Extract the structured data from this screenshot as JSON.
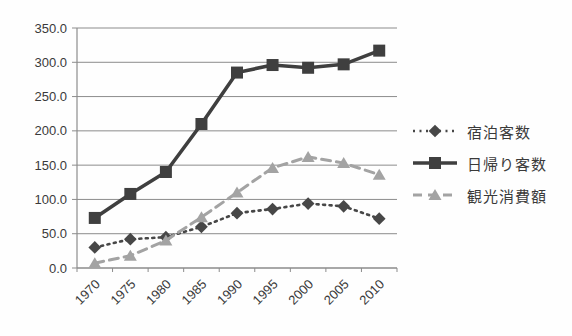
{
  "chart_data": {
    "type": "line",
    "title": "",
    "xlabel": "",
    "ylabel": "",
    "categories": [
      "1970",
      "1975",
      "1980",
      "1985",
      "1990",
      "1995",
      "2000",
      "2005",
      "2010"
    ],
    "series": [
      {
        "name": "宿泊客数",
        "values": [
          30,
          42,
          45,
          60,
          80,
          86,
          94,
          90,
          72
        ],
        "color": "#474747",
        "line_style": "dotted",
        "marker": "diamond"
      },
      {
        "name": "日帰り客数",
        "values": [
          73,
          108,
          140,
          210,
          285,
          296,
          292,
          297,
          317
        ],
        "color": "#3f3f3f",
        "line_style": "solid",
        "marker": "square"
      },
      {
        "name": "観光消費額",
        "values": [
          7,
          18,
          40,
          74,
          110,
          146,
          162,
          153,
          136
        ],
        "color": "#a3a3a3",
        "line_style": "dashed",
        "marker": "triangle"
      }
    ],
    "ylim": [
      0,
      350
    ],
    "y_tick_step": 50,
    "y_tick_labels": [
      "0.0",
      "50.0",
      "100.0",
      "150.0",
      "200.0",
      "250.0",
      "300.0",
      "350.0"
    ],
    "grid": true,
    "legend_position": "right",
    "x_labels_rotated_degrees": -45
  },
  "colors": {
    "background": "#fefefe",
    "gridline": "#8c8c8c",
    "axis": "#8c8c8c",
    "tick_text": "#3a3a3a",
    "legend_text": "#3a3a3a"
  }
}
